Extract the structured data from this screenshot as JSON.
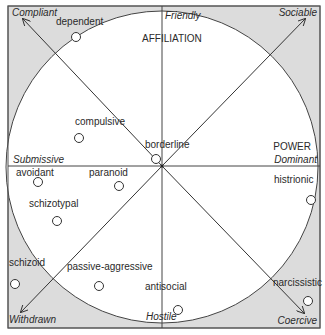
{
  "diagram": {
    "title_vertical": "AFFILIATION",
    "title_horizontal": "POWER",
    "colors": {
      "fill_gray": "#dcdcdc",
      "line": "#333333",
      "background": "#ffffff"
    },
    "axes": {
      "top": "Friendly",
      "bottom": "Hostile",
      "left": "Submissive",
      "right": "Dominant"
    },
    "corners": {
      "top_left": "Compliant",
      "top_right": "Sociable",
      "bottom_left": "Withdrawn",
      "bottom_right": "Coercive"
    },
    "disorders": [
      {
        "name": "dependent",
        "cx": 76,
        "cy": 37,
        "lx": 67,
        "ly": 23
      },
      {
        "name": "compulsive",
        "cx": 79,
        "cy": 138,
        "lx": 104,
        "ly": 124
      },
      {
        "name": "borderline",
        "cx": 155,
        "cy": 179,
        "lx": 159,
        "ly": 148
      },
      {
        "name": "avoidant",
        "cx": 38,
        "cy": 182,
        "lx": 35,
        "ly": 176
      },
      {
        "name": "paranoid",
        "cx": 119,
        "cy": 186,
        "lx": 112,
        "ly": 176
      },
      {
        "name": "schizotypal",
        "cx": 57,
        "cy": 221,
        "lx": 48,
        "ly": 206
      },
      {
        "name": "histrionic",
        "cx": 311,
        "cy": 201,
        "lx": 260,
        "ly": 183
      },
      {
        "name": "schizoid",
        "cx": 14,
        "cy": 284,
        "lx": 25,
        "ly": 264
      },
      {
        "name": "passive-aggressive",
        "cx": 99,
        "cy": 286,
        "lx": 117,
        "ly": 269
      },
      {
        "name": "antisocial",
        "cx": 178,
        "cy": 310,
        "lx": 169,
        "ly": 290
      },
      {
        "name": "narcissistic",
        "cx": 308,
        "cy": 301,
        "lx": 292,
        "ly": 286
      }
    ]
  }
}
